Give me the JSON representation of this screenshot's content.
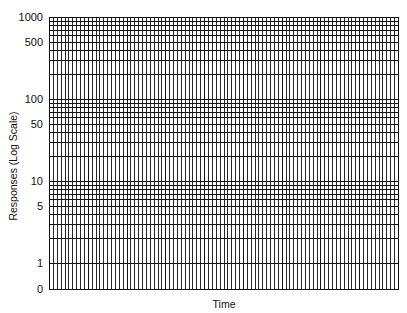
{
  "chart_data": {
    "type": "line",
    "title": "",
    "xlabel": "Time",
    "ylabel": "Responses (Log Scale)",
    "yscale": "log",
    "ylim": [
      0,
      1000
    ],
    "ytick_labels": [
      "1000",
      "500",
      "100",
      "50",
      "10",
      "5",
      "1",
      "0"
    ],
    "ytick_values": [
      1000,
      500,
      100,
      50,
      10,
      5,
      1,
      0
    ],
    "x_major_divisions": 9,
    "x_minor_per_major": 10,
    "decades": [
      1,
      10,
      100,
      1000
    ],
    "grid": true,
    "series": [],
    "legend": null
  },
  "layout": {
    "plot_left": 49,
    "plot_right": 398,
    "plot_top": 17,
    "plot_bottom": 289,
    "decade_px": 82,
    "one_line_y": 263,
    "line_color": "#111111"
  },
  "labels": {
    "x_axis": "Time",
    "y_axis": "Responses (Log Scale)"
  }
}
